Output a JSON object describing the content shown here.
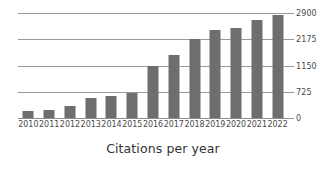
{
  "chart_data": {
    "type": "bar",
    "title": "Citations per year",
    "xlabel": "",
    "ylabel": "",
    "categories": [
      "2010",
      "2011",
      "2012",
      "2013",
      "2014",
      "2015",
      "2016",
      "2017",
      "2018",
      "2019",
      "2020",
      "2021",
      "2022"
    ],
    "values": [
      190,
      230,
      320,
      560,
      620,
      680,
      1150,
      1580,
      2175,
      2430,
      2480,
      2720,
      2840
    ],
    "series": [
      {
        "name": "Citations",
        "values": [
          190,
          230,
          320,
          560,
          620,
          680,
          1150,
          1580,
          2175,
          2430,
          2480,
          2720,
          2840
        ]
      }
    ],
    "ytick_labels": [
      "2900",
      "2175",
      "1150",
      "725",
      "0"
    ],
    "ytick_values": [
      2900,
      2175,
      1150,
      725,
      0
    ],
    "ylim": [
      0,
      2900
    ],
    "grid": true,
    "legend": false,
    "legend_position": "none",
    "bar_color": "#6e6e6e",
    "grid_color": "#9a9a9a",
    "background_color": "#ffffff",
    "text_color": "#4a4a4a"
  },
  "chart": {
    "title": "Citations per year"
  }
}
